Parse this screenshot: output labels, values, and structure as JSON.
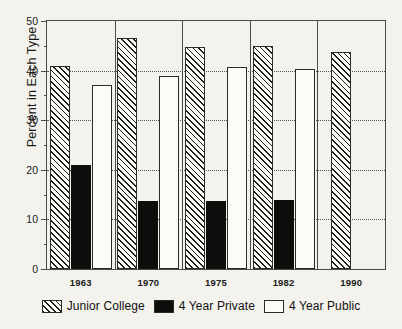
{
  "chart_data": {
    "type": "bar",
    "title": "",
    "subtitle": "",
    "xlabel": "",
    "ylabel": "Percent in Each Type",
    "categories": [
      "1963",
      "1970",
      "1975",
      "1982",
      "1990"
    ],
    "ylim": [
      0,
      50
    ],
    "yticks": [
      0,
      10,
      20,
      30,
      40,
      50
    ],
    "ytick_labels": [
      "0",
      "10",
      "20",
      "30",
      "40",
      "50"
    ],
    "yminor_ticks": [
      5,
      15,
      25,
      35,
      45
    ],
    "grid": "horizontal-dotted at 10,20,30,40",
    "panel_separators": true,
    "legend_position": "bottom-center",
    "series": [
      {
        "name": "Junior College",
        "pattern": "diagonal-hatch",
        "values": [
          41.0,
          46.5,
          44.8,
          45.0,
          43.8
        ]
      },
      {
        "name": "4 Year Private",
        "pattern": "solid-black",
        "values": [
          21.0,
          13.7,
          13.7,
          14.0,
          null
        ]
      },
      {
        "name": "4 Year Public",
        "pattern": "checkerboard",
        "values": [
          37.0,
          39.0,
          40.8,
          40.3,
          null
        ]
      }
    ],
    "annotations": []
  },
  "legend": {
    "items": [
      {
        "label": "Junior College",
        "swatch": "hatch-swatch"
      },
      {
        "label": "4 Year Private",
        "swatch": "solid-black-swatch"
      },
      {
        "label": "4 Year Public",
        "swatch": "checkerboard-swatch"
      }
    ]
  },
  "colors": {
    "background": "#f4f2ec",
    "axis": "#4a4a46",
    "ink": "#1d1d1b",
    "bar_fill": "#fbfaf6",
    "solid_bar": "#0d0d0c"
  }
}
